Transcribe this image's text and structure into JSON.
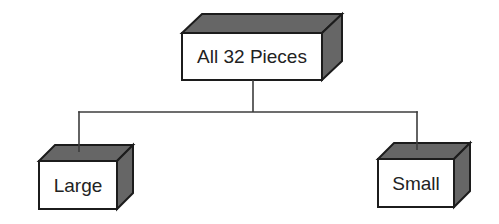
{
  "diagram": {
    "type": "tree",
    "nodes": {
      "root": {
        "label": "All 32 Pieces"
      },
      "children": [
        {
          "label": "Large"
        },
        {
          "label": "Small"
        }
      ]
    },
    "edges": [
      {
        "from": "All 32 Pieces",
        "to": "Large"
      },
      {
        "from": "All 32 Pieces",
        "to": "Small"
      }
    ]
  },
  "colors": {
    "background": "#ffffff",
    "box_front_face": "#ffffff",
    "box_shaded_face": "#666666",
    "box_outline": "#1c1c1c",
    "connector": "#3d3d3d"
  }
}
